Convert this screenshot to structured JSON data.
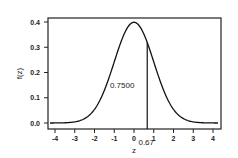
{
  "chart_data": {
    "type": "line",
    "title": "",
    "xlabel": "z",
    "ylabel": "f(z)",
    "xlim": [
      -4.3,
      4.3
    ],
    "ylim": [
      -0.02,
      0.42
    ],
    "x_ticks": [
      "-4",
      "-3",
      "-2",
      "-1",
      "0",
      "1",
      "2",
      "3",
      "4"
    ],
    "y_ticks": [
      "0.0",
      "0.1",
      "0.2",
      "0.3",
      "0.4"
    ],
    "grid": false,
    "series": [
      {
        "name": "standard normal pdf",
        "function": "normal_pdf",
        "mean": 0,
        "sd": 1
      }
    ],
    "annotations": [
      {
        "type": "vline",
        "x": 0.67,
        "label": "0.67"
      },
      {
        "type": "text",
        "text": "0.7500",
        "x": -0.6,
        "y": 0.15
      }
    ]
  }
}
